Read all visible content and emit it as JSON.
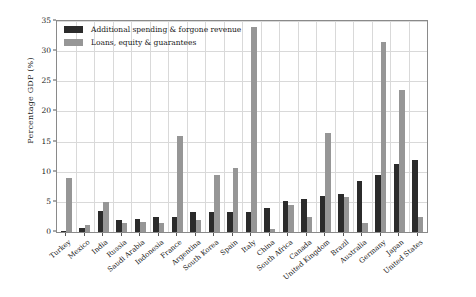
{
  "chart_data": {
    "type": "bar",
    "title": "",
    "xlabel": "",
    "ylabel": "Percentage GDP (%)",
    "ylim": [
      0,
      35
    ],
    "yticks": [
      0,
      5,
      10,
      15,
      20,
      25,
      30,
      35
    ],
    "grid": true,
    "legend_position": "upper-left",
    "colors": {
      "additional_spending": "#2b2b2b",
      "loans_equity": "#969696",
      "gridline": "#d9d9d9",
      "frame": "#8a8a8a",
      "text": "#1a1a1a"
    },
    "categories": [
      "Turkey",
      "Mexico",
      "India",
      "Russia",
      "Saudi Arabia",
      "Indonesia",
      "France",
      "Argentina",
      "South Korea",
      "Spain",
      "Italy",
      "China",
      "South Africa",
      "Canada",
      "United Kingdom",
      "Brazil",
      "Australia",
      "Germany",
      "Japan",
      "United States"
    ],
    "series": [
      {
        "name": "Additional spending & forgone revenue",
        "color": "#2b2b2b",
        "values": [
          0.2,
          0.7,
          3.5,
          2.0,
          2.2,
          2.5,
          2.5,
          3.3,
          3.4,
          3.4,
          3.4,
          4.0,
          5.2,
          5.4,
          6.0,
          6.3,
          8.5,
          9.5,
          11.3,
          12.0
        ]
      },
      {
        "name": "Loans, equity & guarantees",
        "color": "#969696",
        "values": [
          9.0,
          1.2,
          5.0,
          1.5,
          1.6,
          1.5,
          16.0,
          2.0,
          9.5,
          10.6,
          34.0,
          0.5,
          4.4,
          2.5,
          16.5,
          5.8,
          1.5,
          31.5,
          23.5,
          2.5
        ]
      }
    ]
  },
  "legend": {
    "items": [
      {
        "label": "Additional spending & forgone revenue",
        "swatch": "a"
      },
      {
        "label": "Loans, equity & guarantees",
        "swatch": "b"
      }
    ]
  },
  "axis": {
    "y_title": "Percentage GDP (%)"
  }
}
